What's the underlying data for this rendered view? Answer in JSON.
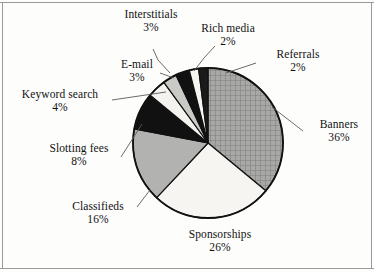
{
  "chart_data": {
    "type": "pie",
    "title": "",
    "subtitle": "",
    "xlabel": "",
    "ylabel": "",
    "legend": "none",
    "labels_position": "outside-with-leader-lines",
    "grid": false,
    "units": "percent",
    "categories": [
      "Banners",
      "Sponsorships",
      "Classifieds",
      "Slotting fees",
      "Keyword search",
      "E-mail",
      "Interstitials",
      "Rich media",
      "Referrals"
    ],
    "values": [
      36,
      26,
      16,
      8,
      4,
      3,
      3,
      2,
      2
    ],
    "slices": [
      {
        "name": "Banners",
        "value": 36,
        "value_text": "36%",
        "fill": "crosshatch-gray",
        "color": "#9a9a9a"
      },
      {
        "name": "Sponsorships",
        "value": 26,
        "value_text": "26%",
        "fill": "solid",
        "color": "#f6f5f1"
      },
      {
        "name": "Classifieds",
        "value": 16,
        "value_text": "16%",
        "fill": "solid",
        "color": "#b2b2b0"
      },
      {
        "name": "Slotting fees",
        "value": 8,
        "value_text": "8%",
        "fill": "solid",
        "color": "#111111"
      },
      {
        "name": "Keyword search",
        "value": 4,
        "value_text": "4%",
        "fill": "solid",
        "color": "#f4f3ef"
      },
      {
        "name": "E-mail",
        "value": 3,
        "value_text": "3%",
        "fill": "solid",
        "color": "#c9c9c6"
      },
      {
        "name": "Interstitials",
        "value": 3,
        "value_text": "3%",
        "fill": "solid",
        "color": "#111111"
      },
      {
        "name": "Rich media",
        "value": 2,
        "value_text": "2%",
        "fill": "solid",
        "color": "#f6f5f1"
      },
      {
        "name": "Referrals",
        "value": 2,
        "value_text": "2%",
        "fill": "solid",
        "color": "#1a1a1a"
      }
    ]
  },
  "labels": {
    "interstitials": {
      "name": "Interstitials",
      "value": "3%"
    },
    "rich_media": {
      "name": "Rich media",
      "value": "2%"
    },
    "referrals": {
      "name": "Referrals",
      "value": "2%"
    },
    "banners": {
      "name": "Banners",
      "value": "36%"
    },
    "sponsorships": {
      "name": "Sponsorships",
      "value": "26%"
    },
    "classifieds": {
      "name": "Classifieds",
      "value": "16%"
    },
    "slotting_fees": {
      "name": "Slotting fees",
      "value": "8%"
    },
    "keyword_search": {
      "name": "Keyword search",
      "value": "4%"
    },
    "email": {
      "name": "E-mail",
      "value": "3%"
    }
  },
  "colors": {
    "background": "#fdfdfc",
    "outline": "#111111",
    "leader_line": "#5a5a58",
    "frame": "#9a9a96",
    "text": "#111111"
  }
}
